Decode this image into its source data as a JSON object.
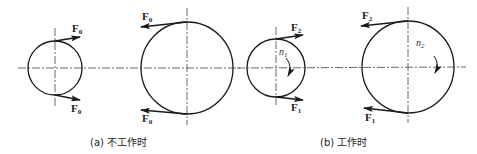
{
  "figure": {
    "panels": [
      {
        "id": "a",
        "caption": "(a) 不工作时",
        "small_pulley": {
          "top_force": "F",
          "top_sub": "0",
          "bottom_force": "F",
          "bottom_sub": "0"
        },
        "large_pulley": {
          "top_force": "F",
          "top_sub": "0",
          "bottom_force": "F",
          "bottom_sub": "0"
        }
      },
      {
        "id": "b",
        "caption": "(b) 工作时",
        "small_pulley": {
          "top_force": "F",
          "top_sub": "2",
          "bottom_force": "F",
          "bottom_sub": "1",
          "speed": "n",
          "speed_sub": "1"
        },
        "large_pulley": {
          "top_force": "F",
          "top_sub": "2",
          "bottom_force": "F",
          "bottom_sub": "1",
          "speed": "n",
          "speed_sub": "2"
        }
      }
    ]
  },
  "colors": {
    "line": "#1a1a1a",
    "center_line": "#444444",
    "background": "#ffffff"
  }
}
